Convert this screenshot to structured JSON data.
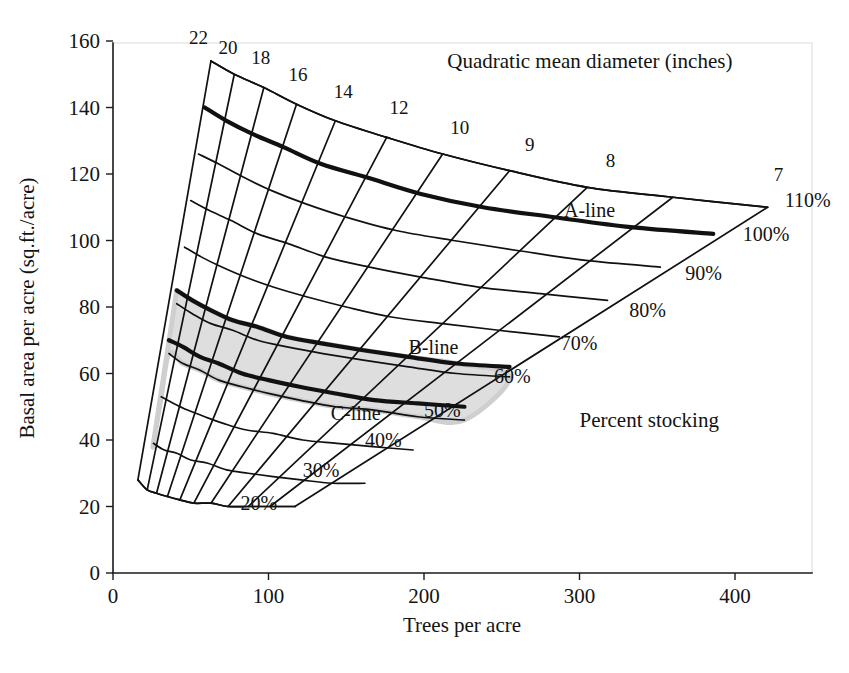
{
  "figure": {
    "kind": "gingrich-stocking-chart",
    "background_color": "#ffffff",
    "line_color": "#111111",
    "shade_color": "#dedede",
    "shade_edge_color": "#cfcfcf"
  },
  "chart_data": {
    "type": "line",
    "title": "",
    "xlabel": "Trees per acre",
    "ylabel": "Basal area per acre (sq.ft./acre)",
    "xlim": [
      0,
      450
    ],
    "ylim": [
      0,
      160
    ],
    "xticks": [
      0,
      100,
      200,
      300,
      400
    ],
    "yticks": [
      0,
      20,
      40,
      60,
      80,
      100,
      120,
      140,
      160
    ],
    "grid": false,
    "legend": "none",
    "annotations": [
      {
        "text": "Quadratic mean diameter (inches)",
        "x": 215,
        "y": 152,
        "name": "diameter-axis-title"
      },
      {
        "text": "Percent stocking",
        "x": 300,
        "y": 44,
        "name": "percent-stocking-title"
      },
      {
        "text": "A-line",
        "x": 290,
        "y": 107,
        "name": "a-line-label"
      },
      {
        "text": "B-line",
        "x": 190,
        "y": 66,
        "name": "b-line-label"
      },
      {
        "text": "C-line",
        "x": 140,
        "y": 46,
        "name": "c-line-label"
      }
    ],
    "stocking_series": [
      {
        "label": "110%",
        "percent": 110,
        "thick": false,
        "points": [
          [
            63,
            154
          ],
          [
            78,
            150
          ],
          [
            97,
            146
          ],
          [
            118,
            141
          ],
          [
            143,
            136
          ],
          [
            176,
            131
          ],
          [
            212,
            126
          ],
          [
            255,
            121
          ],
          [
            305,
            116
          ],
          [
            360,
            113
          ],
          [
            421,
            110
          ]
        ]
      },
      {
        "label": "100%",
        "percent": 100,
        "thick": true,
        "points": [
          [
            59,
            140
          ],
          [
            73,
            136
          ],
          [
            90,
            132
          ],
          [
            110,
            128
          ],
          [
            134,
            123
          ],
          [
            163,
            119
          ],
          [
            198,
            114
          ],
          [
            238,
            110
          ],
          [
            284,
            107
          ],
          [
            333,
            104
          ],
          [
            386,
            102
          ]
        ]
      },
      {
        "label": "90%",
        "percent": 90,
        "thick": false,
        "points": [
          [
            55,
            126
          ],
          [
            68,
            123
          ],
          [
            84,
            119
          ],
          [
            102,
            115
          ],
          [
            124,
            111
          ],
          [
            150,
            107
          ],
          [
            182,
            103
          ],
          [
            219,
            100
          ],
          [
            260,
            97
          ],
          [
            304,
            94
          ],
          [
            352,
            92
          ]
        ]
      },
      {
        "label": "80%",
        "percent": 80,
        "thick": false,
        "points": [
          [
            50,
            112
          ],
          [
            62,
            109
          ],
          [
            76,
            106
          ],
          [
            93,
            102
          ],
          [
            113,
            99
          ],
          [
            137,
            95
          ],
          [
            165,
            92
          ],
          [
            198,
            89
          ],
          [
            235,
            86
          ],
          [
            275,
            84
          ],
          [
            318,
            82
          ]
        ]
      },
      {
        "label": "70%",
        "percent": 70,
        "thick": false,
        "points": [
          [
            46,
            98
          ],
          [
            57,
            95
          ],
          [
            70,
            92
          ],
          [
            85,
            89
          ],
          [
            103,
            86
          ],
          [
            125,
            83
          ],
          [
            150,
            80
          ],
          [
            179,
            77
          ],
          [
            212,
            75
          ],
          [
            248,
            73
          ],
          [
            287,
            71
          ]
        ]
      },
      {
        "label": "B-line",
        "percent": 60,
        "thick": true,
        "points": [
          [
            41,
            85
          ],
          [
            51,
            82
          ],
          [
            63,
            79
          ],
          [
            77,
            76
          ],
          [
            93,
            74
          ],
          [
            112,
            71
          ],
          [
            135,
            69
          ],
          [
            161,
            67
          ],
          [
            190,
            65
          ],
          [
            221,
            63
          ],
          [
            255,
            62
          ]
        ]
      },
      {
        "label": "60%",
        "percent": 60,
        "thick": false,
        "points": [
          [
            41,
            81
          ],
          [
            51,
            78
          ],
          [
            63,
            75
          ],
          [
            77,
            73
          ],
          [
            93,
            70
          ],
          [
            112,
            68
          ],
          [
            135,
            66
          ],
          [
            161,
            64
          ],
          [
            190,
            62
          ],
          [
            221,
            60
          ],
          [
            255,
            59
          ]
        ]
      },
      {
        "label": "C-line",
        "percent": 50,
        "thick": true,
        "points": [
          [
            36,
            70
          ],
          [
            45,
            68
          ],
          [
            56,
            65
          ],
          [
            68,
            63
          ],
          [
            83,
            60
          ],
          [
            100,
            58
          ],
          [
            120,
            56
          ],
          [
            143,
            54
          ],
          [
            168,
            52
          ],
          [
            196,
            51
          ],
          [
            226,
            50
          ]
        ]
      },
      {
        "label": "50%",
        "percent": 50,
        "thick": false,
        "points": [
          [
            36,
            66
          ],
          [
            45,
            63
          ],
          [
            56,
            61
          ],
          [
            68,
            58
          ],
          [
            83,
            56
          ],
          [
            100,
            54
          ],
          [
            120,
            52
          ],
          [
            143,
            50
          ],
          [
            168,
            49
          ],
          [
            196,
            47
          ],
          [
            226,
            46
          ]
        ]
      },
      {
        "label": "40%",
        "percent": 40,
        "thick": false,
        "points": [
          [
            31,
            53
          ],
          [
            39,
            51
          ],
          [
            48,
            49
          ],
          [
            59,
            47
          ],
          [
            71,
            45
          ],
          [
            86,
            43
          ],
          [
            103,
            42
          ],
          [
            122,
            40
          ],
          [
            144,
            39
          ],
          [
            167,
            38
          ],
          [
            193,
            37
          ]
        ]
      },
      {
        "label": "30%",
        "percent": 30,
        "thick": false,
        "points": [
          [
            26,
            39
          ],
          [
            33,
            37
          ],
          [
            41,
            36
          ],
          [
            50,
            34
          ],
          [
            61,
            33
          ],
          [
            73,
            31
          ],
          [
            87,
            30
          ],
          [
            103,
            29
          ],
          [
            121,
            28
          ],
          [
            141,
            27
          ],
          [
            162,
            27
          ]
        ]
      },
      {
        "label": "20%",
        "percent": 20,
        "thick": false,
        "points": [
          [
            16,
            28
          ],
          [
            22,
            25
          ],
          [
            28,
            24
          ],
          [
            35,
            23
          ],
          [
            43,
            22
          ],
          [
            52,
            21
          ],
          [
            63,
            21
          ],
          [
            74,
            20
          ],
          [
            87,
            20
          ],
          [
            101,
            20
          ],
          [
            117,
            20
          ]
        ]
      }
    ],
    "diameter_lines": [
      {
        "label": "22",
        "diameter": 22,
        "from": [
          63,
          154
        ],
        "to": [
          16,
          28
        ]
      },
      {
        "label": "20",
        "diameter": 20,
        "from": [
          78,
          150
        ],
        "to": [
          22,
          25
        ]
      },
      {
        "label": "18",
        "diameter": 18,
        "from": [
          97,
          146
        ],
        "to": [
          28,
          24
        ]
      },
      {
        "label": "16",
        "diameter": 16,
        "from": [
          118,
          141
        ],
        "to": [
          35,
          23
        ]
      },
      {
        "label": "14",
        "diameter": 14,
        "from": [
          143,
          136
        ],
        "to": [
          43,
          22
        ]
      },
      {
        "label": "12",
        "diameter": 12,
        "from": [
          176,
          131
        ],
        "to": [
          52,
          21
        ]
      },
      {
        "label": "10",
        "diameter": 10,
        "from": [
          212,
          126
        ],
        "to": [
          63,
          21
        ]
      },
      {
        "label": "9",
        "diameter": 9,
        "from": [
          255,
          121
        ],
        "to": [
          74,
          20
        ]
      },
      {
        "label": "8",
        "diameter": 8,
        "from": [
          305,
          116
        ],
        "to": [
          87,
          20
        ]
      },
      {
        "label": "7",
        "diameter": 7,
        "from": [
          360,
          113
        ],
        "to": [
          101,
          20
        ]
      },
      {
        "label": "",
        "diameter": 6.5,
        "from": [
          421,
          110
        ],
        "to": [
          117,
          20
        ]
      }
    ],
    "diameter_labels": [
      {
        "text": "22",
        "x": 55,
        "y": 159
      },
      {
        "text": "20",
        "x": 74,
        "y": 156
      },
      {
        "text": "18",
        "x": 95,
        "y": 153
      },
      {
        "text": "16",
        "x": 119,
        "y": 148
      },
      {
        "text": "14",
        "x": 148,
        "y": 143
      },
      {
        "text": "12",
        "x": 184,
        "y": 138
      },
      {
        "text": "10",
        "x": 223,
        "y": 132
      },
      {
        "text": "9",
        "x": 268,
        "y": 127
      },
      {
        "text": "8",
        "x": 320,
        "y": 122
      },
      {
        "text": "7",
        "x": 428,
        "y": 118
      }
    ],
    "percent_labels": [
      {
        "text": "110%",
        "x": 432,
        "y": 110
      },
      {
        "text": "100%",
        "x": 405,
        "y": 100
      },
      {
        "text": "90%",
        "x": 368,
        "y": 88
      },
      {
        "text": "80%",
        "x": 332,
        "y": 77
      },
      {
        "text": "70%",
        "x": 288,
        "y": 67
      },
      {
        "text": "60%",
        "x": 245,
        "y": 57
      },
      {
        "text": "50%",
        "x": 200,
        "y": 47
      },
      {
        "text": "40%",
        "x": 162,
        "y": 38
      },
      {
        "text": "30%",
        "x": 122,
        "y": 29
      },
      {
        "text": "20%",
        "x": 82,
        "y": 19
      }
    ],
    "shaded_region": {
      "description": "B-line to C-line fully stocked band",
      "outline": [
        [
          41,
          85
        ],
        [
          51,
          82
        ],
        [
          63,
          79
        ],
        [
          77,
          76
        ],
        [
          93,
          74
        ],
        [
          112,
          71
        ],
        [
          135,
          69
        ],
        [
          161,
          67
        ],
        [
          190,
          65
        ],
        [
          221,
          63
        ],
        [
          255,
          59
        ],
        [
          226,
          46
        ],
        [
          196,
          47
        ],
        [
          168,
          49
        ],
        [
          143,
          50
        ],
        [
          120,
          52
        ],
        [
          100,
          54
        ],
        [
          83,
          56
        ],
        [
          68,
          58
        ],
        [
          56,
          61
        ],
        [
          45,
          63
        ],
        [
          36,
          66
        ],
        [
          31,
          53
        ],
        [
          26,
          39
        ],
        [
          41,
          85
        ]
      ]
    }
  },
  "axes": {
    "y_label": "Basal area per acre (sq.ft./acre)",
    "x_label": "Trees per acre",
    "y_tick_labels": [
      "0",
      "20",
      "40",
      "60",
      "80",
      "100",
      "120",
      "140",
      "160"
    ],
    "x_tick_labels": [
      "0",
      "100",
      "200",
      "300",
      "400"
    ]
  }
}
